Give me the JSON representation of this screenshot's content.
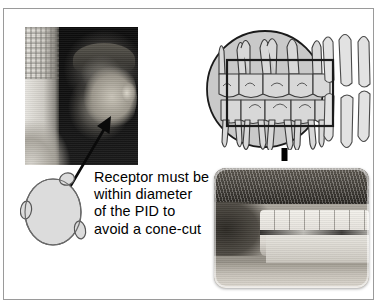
{
  "figure": {
    "name": "receptor-pid-alignment-figure",
    "background_color": "#ffffff",
    "border_color": "#9a9a9a",
    "caption_lines": [
      "Receptor must be",
      "within diameter",
      "of the PID to",
      "avoid a cone-cut"
    ],
    "caption_text": "Receptor must be within diameter of the PID to avoid a cone-cut"
  },
  "panels": {
    "patient_photo": {
      "label": "patient-profile-photo",
      "description": "Grayscale profile photograph of a seated patient wearing a gown",
      "arrow_target": "cheek"
    },
    "receptor_illustration": {
      "label": "receptor-ellipse",
      "fill_color": "#dcdcdc",
      "outline_color": "#555555",
      "tab_count": 3
    },
    "teeth_diagram": {
      "label": "teeth-line-diagram",
      "pid_circle": {
        "label": "pid-circle",
        "fill_color": "#c9c9c9",
        "outline_color": "#1a1a1a"
      },
      "receptor_rectangle": {
        "label": "receptor-rectangle",
        "outline_color": "#1a1a1a"
      },
      "upper_arch_teeth": 5,
      "lower_arch_teeth": 5,
      "anterior_teeth": 4
    },
    "alignment_line": {
      "label": "vertical-dashed-alignment-line",
      "color": "#000000",
      "style": "dashed"
    },
    "clinical_photo": {
      "label": "clinical-teeth-photo",
      "description": "Grayscale intraoral photograph of teeth in occlusion with lips retracted"
    }
  }
}
